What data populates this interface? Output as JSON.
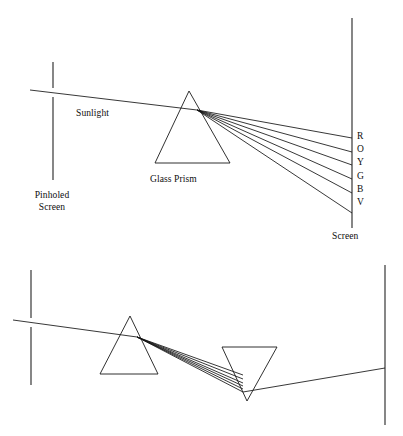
{
  "figure": {
    "background_color": "#ffffff",
    "line_color": "#1a1a1a",
    "text_color": "#0d0d0d"
  },
  "top_diagram": {
    "labels": {
      "sunlight": "Sunlight",
      "glass_prism": "Glass Prism",
      "pinholed_screen_line1": "Pinholed",
      "pinholed_screen_line2": "Screen",
      "screen": "Screen"
    },
    "spectrum": {
      "letters": [
        "R",
        "O",
        "Y",
        "G",
        "B",
        "V"
      ],
      "names": [
        "Red",
        "Orange",
        "Yellow",
        "Green",
        "Blue",
        "Violet"
      ]
    },
    "geometry": {
      "pinhole_screen_x": 53,
      "pinhole_screen_top_y": 62,
      "pinhole_screen_gap_top_y": 88,
      "pinhole_screen_gap_bottom_y": 97,
      "pinhole_screen_bottom_y": 180,
      "incoming_ray_start": [
        30,
        90
      ],
      "incoming_ray_end": [
        197,
        110
      ],
      "prism_apex": [
        189,
        91
      ],
      "prism_base_left": [
        155,
        163
      ],
      "prism_base_right": [
        230,
        163
      ],
      "fan_origin": [
        197,
        110
      ],
      "screen_x": 352,
      "screen_top_y": 18,
      "screen_bottom_y": 228,
      "ray_end_y": [
        138,
        152,
        165,
        179,
        193,
        213
      ]
    }
  },
  "bottom_diagram": {
    "geometry": {
      "pinhole_screen_x": 31,
      "pinhole_screen_top_y": 270,
      "pinhole_screen_gap_top_y": 318,
      "pinhole_screen_gap_bottom_y": 327,
      "pinhole_screen_bottom_y": 385,
      "incoming_ray_start": [
        13,
        320
      ],
      "incoming_ray_end": [
        137,
        337
      ],
      "prism1_apex": [
        130,
        316
      ],
      "prism1_base_left": [
        100,
        374
      ],
      "prism1_base_right": [
        158,
        374
      ],
      "fan_origin": [
        137,
        337
      ],
      "prism2_top_left": [
        222,
        347
      ],
      "prism2_top_right": [
        277,
        347
      ],
      "prism2_apex": [
        247,
        401
      ],
      "converge_point": [
        243,
        392
      ],
      "exit_ray_end": [
        385,
        368
      ],
      "screen_x": 385,
      "screen_top_y": 265,
      "screen_bottom_y": 425,
      "ray_end_y": [
        352,
        360,
        368,
        375,
        382,
        390
      ]
    }
  }
}
